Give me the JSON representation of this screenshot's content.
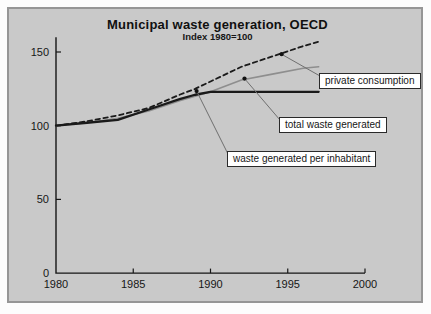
{
  "chart_data": {
    "type": "line",
    "title": "Municipal waste generation, OECD",
    "subtitle": "Index 1980=100",
    "x": [
      1980,
      1982,
      1984,
      1986,
      1988,
      1989,
      1990,
      1992,
      1994,
      1996,
      1997
    ],
    "series": [
      {
        "name": "private consumption",
        "style": "dashed",
        "color": "#1a1a1a",
        "values": [
          100,
          103,
          107,
          112,
          121,
          125,
          130,
          140,
          147,
          154,
          157
        ]
      },
      {
        "name": "total waste generated",
        "style": "solid",
        "color": "#8e8e8e",
        "values": [
          100,
          102,
          105,
          110,
          117,
          120,
          123,
          131,
          135,
          139,
          140
        ]
      },
      {
        "name": "waste generated per inhabitant",
        "style": "solid-thick",
        "color": "#1a1a1a",
        "values": [
          100,
          102,
          104,
          111,
          118,
          121,
          123,
          123,
          123,
          123,
          123
        ]
      }
    ],
    "xlim": [
      1980,
      2000
    ],
    "ylim": [
      0,
      160
    ],
    "x_ticks": [
      1980,
      1985,
      1990,
      1995,
      2000
    ],
    "y_ticks": [
      0,
      50,
      100,
      150
    ],
    "grid": false,
    "legend_position": "inline-callouts",
    "annotations": [
      {
        "series": 0,
        "anchor_year": 1994.6,
        "anchor_value": 148.5
      },
      {
        "series": 1,
        "anchor_year": 1992.2,
        "anchor_value": 132
      },
      {
        "series": 2,
        "anchor_year": 1989.1,
        "anchor_value": 123.5
      }
    ]
  },
  "colors": {
    "panel_bg": "#c9c9c9",
    "panel_border": "#969696",
    "axis": "#161616",
    "leader_line": "#6f6f6f",
    "callout_bg": "#ffffff"
  }
}
